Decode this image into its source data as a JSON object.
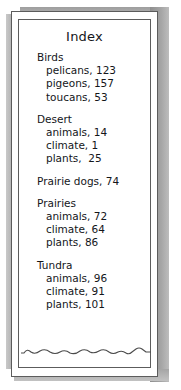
{
  "page": {
    "title": "Index",
    "groups": [
      {
        "heading": "Birds",
        "entries": [
          {
            "text": "pelicans, 123"
          },
          {
            "text": "pigeons, 157"
          },
          {
            "text": "toucans, 53"
          }
        ]
      },
      {
        "heading": "Desert",
        "entries": [
          {
            "text": "animals, 14"
          },
          {
            "text": "climate, 1"
          },
          {
            "text": "plants,  25"
          }
        ]
      },
      {
        "heading": "Prairie dogs, 74",
        "entries": []
      },
      {
        "heading": "Prairies",
        "entries": [
          {
            "text": "animals, 72"
          },
          {
            "text": "climate, 64"
          },
          {
            "text": "plants, 86"
          }
        ]
      },
      {
        "heading": "Tundra",
        "entries": [
          {
            "text": "animals, 96"
          },
          {
            "text": "climate, 91"
          },
          {
            "text": "plants, 101"
          }
        ]
      }
    ]
  },
  "decor": {
    "torn_edge_name": "wavy-torn-edge-line",
    "page_shadow_name": "page-drop-shadow"
  },
  "colors": {
    "paper": "#ffffff",
    "ink": "#14161a",
    "rule": "#5c5c5c",
    "shadow": "#9a9a9a"
  }
}
